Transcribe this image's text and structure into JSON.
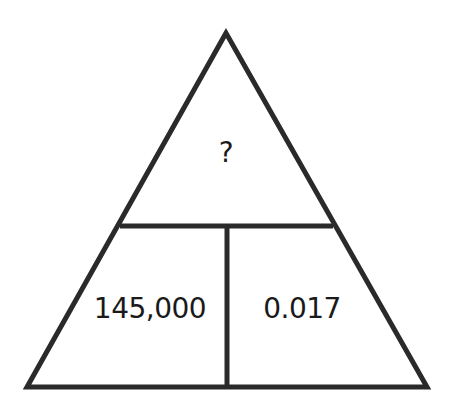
{
  "diagram": {
    "type": "formula-triangle",
    "top": {
      "value": "?"
    },
    "bottom_left": {
      "value": "145,000"
    },
    "bottom_right": {
      "value": "0.017"
    },
    "line_color": "#2a2a2a",
    "text_color": "#1a1a1a"
  }
}
